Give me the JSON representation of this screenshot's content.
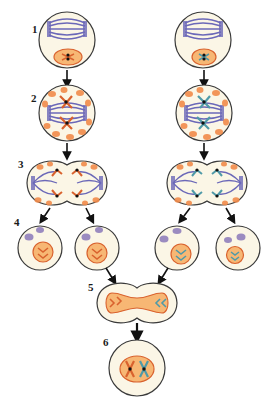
{
  "diagram": {
    "step_labels": [
      "1",
      "2",
      "3",
      "4",
      "5",
      "6"
    ],
    "colors": {
      "cytoplasm": "#fbf6e6",
      "outline": "#3a3a3a",
      "spindle": "#6b68b8",
      "maternal_chromosome": "#d9622e",
      "paternal_chromosome": "#4f9aa8",
      "nucleus_fill": "#f7b774",
      "organelle": "#f28b4a",
      "polar_body": "#8a78b8",
      "arrow": "#111111"
    },
    "lineages": [
      {
        "side": "left",
        "chromosome_color": "maternal"
      },
      {
        "side": "right",
        "chromosome_color": "paternal"
      }
    ]
  }
}
